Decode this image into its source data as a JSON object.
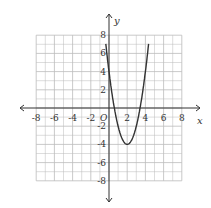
{
  "chart_data": {
    "type": "line",
    "title": "",
    "xlabel": "x",
    "ylabel": "y",
    "origin_label": "O",
    "xlim": [
      -9,
      9
    ],
    "ylim": [
      -9,
      9
    ],
    "grid": true,
    "grid_step": 1,
    "x_ticks": [
      -8,
      -6,
      -4,
      -2,
      2,
      4,
      6,
      8
    ],
    "y_ticks": [
      -8,
      -6,
      -4,
      -2,
      2,
      4,
      6,
      8
    ],
    "x_tick_labels": [
      "-8",
      "-6",
      "-4",
      "-2",
      "2",
      "4",
      "6",
      "8"
    ],
    "y_tick_labels": [
      "-8",
      "-6",
      "-4",
      "-2",
      "2",
      "4",
      "6",
      "8"
    ],
    "series": [
      {
        "name": "parabola",
        "equation": "y = 2(x - 2)^2 - 4",
        "vertex": [
          2,
          -4
        ],
        "y_intercept": 4,
        "x_intercepts": [
          0.59,
          3.41
        ],
        "x": [
          -0.3,
          0,
          0.5,
          1,
          1.5,
          2,
          2.5,
          3,
          3.5,
          4,
          4.3
        ],
        "y": [
          6.58,
          4,
          0.5,
          -2,
          -3.5,
          -4,
          -3.5,
          -2,
          0.5,
          4,
          6.58
        ]
      }
    ],
    "colors": {
      "curve": "#333333",
      "axis": "#333333",
      "grid": "#bbbbbb"
    }
  }
}
